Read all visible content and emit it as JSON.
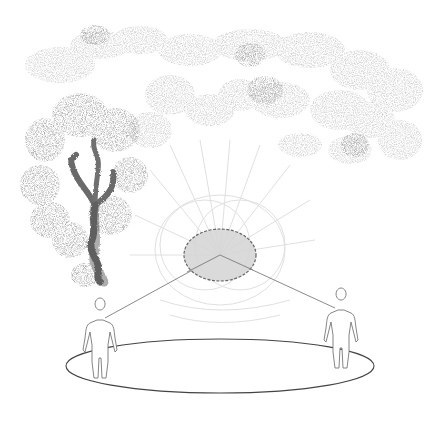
{
  "diagram": {
    "colors": {
      "background": "#ffffff",
      "cloud": "#c8c8c8",
      "cloud_dark": "#a8a8a8",
      "tree": "#6e6e6e",
      "tree_dark": "#555555",
      "ellipse_fill": "#d6d6d6",
      "ellipse_stroke": "#555555",
      "lines": "#8a8a8a",
      "rays": "#e2e2e2",
      "figure_stroke": "#777777",
      "ring_stroke": "#444444"
    },
    "elements": {
      "central_ellipse": {
        "cx": 220,
        "cy": 255,
        "rx": 36,
        "ry": 26
      },
      "ring": {
        "cx": 220,
        "cy": 366,
        "rx": 154,
        "ry": 27
      },
      "left_figure": {
        "x": 97,
        "y": 310
      },
      "right_figure": {
        "x": 340,
        "y": 298
      }
    }
  }
}
